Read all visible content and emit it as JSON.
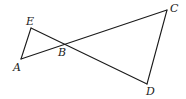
{
  "diagram": {
    "type": "geometry",
    "points": {
      "A": {
        "label": "A",
        "x": 21,
        "y": 59,
        "lx": 13,
        "ly": 71
      },
      "B": {
        "label": "B",
        "x": 66,
        "y": 44,
        "lx": 58,
        "ly": 56
      },
      "C": {
        "label": "C",
        "x": 167,
        "y": 10,
        "lx": 170,
        "ly": 12
      },
      "D": {
        "label": "D",
        "x": 147,
        "y": 84,
        "lx": 146,
        "ly": 95
      },
      "E": {
        "label": "E",
        "x": 31,
        "y": 28,
        "lx": 26,
        "ly": 25
      }
    },
    "segments": [
      {
        "from": "A",
        "to": "E"
      },
      {
        "from": "A",
        "to": "C"
      },
      {
        "from": "E",
        "to": "D"
      },
      {
        "from": "C",
        "to": "D"
      }
    ]
  }
}
